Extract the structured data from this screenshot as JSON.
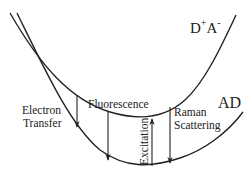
{
  "diagram": {
    "type": "potential-energy-curves",
    "curves": [
      {
        "id": "upper",
        "label_main": "D",
        "label_sup1": "+",
        "label_mid": "A",
        "label_sup2": "-"
      },
      {
        "id": "lower",
        "label": "AD"
      }
    ],
    "arrows": [
      {
        "id": "electron-transfer",
        "line1": "Electron",
        "line2": "Transfer",
        "direction": "down"
      },
      {
        "id": "fluorescence",
        "label": "Fluorescence",
        "direction": "down"
      },
      {
        "id": "excitation",
        "label": "Excitation",
        "direction": "up"
      },
      {
        "id": "raman",
        "line1": "Raman",
        "line2": "Scattering",
        "direction": "down"
      }
    ],
    "stroke_color": "#222222"
  }
}
